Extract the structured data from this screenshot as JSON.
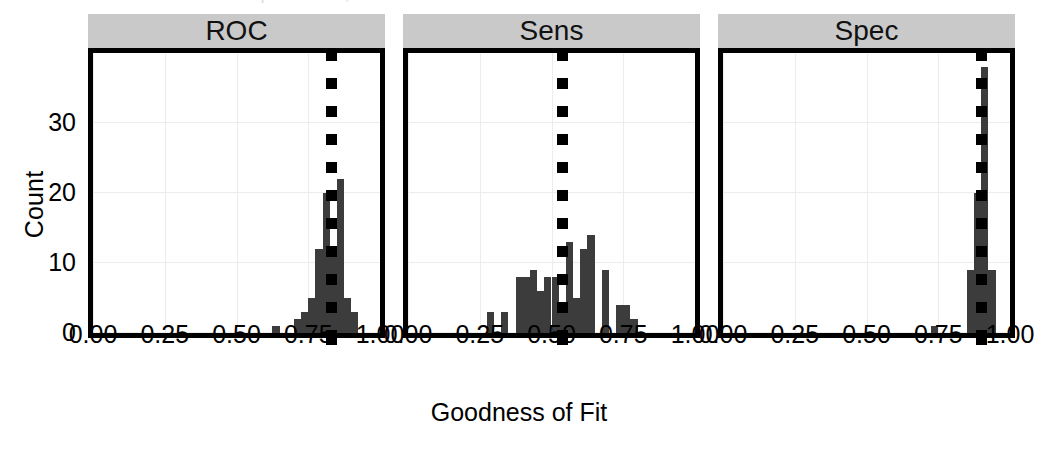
{
  "figure": {
    "clipped_title": "Distribution of model performance, vertical dotted lines",
    "xlabel": "Goodness of Fit",
    "ylabel": "Count"
  },
  "axes": {
    "y_ticks": [
      "0",
      "10",
      "20",
      "30"
    ],
    "y_tick_values": [
      0,
      10,
      20,
      30
    ],
    "ylim": [
      0,
      40
    ],
    "x_ticks": [
      "0.00",
      "0.25",
      "0.50",
      "0.75",
      "1.00"
    ],
    "x_tick_values": [
      0.0,
      0.25,
      0.5,
      0.75,
      1.0
    ],
    "xlim": [
      0,
      1
    ]
  },
  "colors": {
    "strip_background": "#c9c9c9",
    "bar_fill": "#3c3c3c",
    "panel_border": "#000000",
    "grid": "#ececec",
    "refline": "#000000",
    "page_background": "#ffffff"
  },
  "chart_data": {
    "type": "bar",
    "title": "",
    "xlabel": "Goodness of Fit",
    "ylabel": "Count",
    "xlim": [
      0,
      1
    ],
    "ylim": [
      0,
      40
    ],
    "grid": true,
    "legend": "none",
    "facet_labels": [
      "ROC",
      "Sens",
      "Spec"
    ],
    "bin_width": 0.025,
    "panels": [
      {
        "name": "ROC",
        "reference_line": 0.83,
        "bins": [
          {
            "x": 0.6375,
            "count": 1
          },
          {
            "x": 0.7125,
            "count": 2
          },
          {
            "x": 0.7375,
            "count": 3
          },
          {
            "x": 0.7625,
            "count": 5
          },
          {
            "x": 0.7875,
            "count": 12
          },
          {
            "x": 0.8125,
            "count": 20
          },
          {
            "x": 0.8375,
            "count": 12
          },
          {
            "x": 0.8625,
            "count": 22
          },
          {
            "x": 0.8875,
            "count": 5
          },
          {
            "x": 0.9125,
            "count": 3
          }
        ]
      },
      {
        "name": "Sens",
        "reference_line": 0.54,
        "bins": [
          {
            "x": 0.2875,
            "count": 3
          },
          {
            "x": 0.3375,
            "count": 3
          },
          {
            "x": 0.3875,
            "count": 8
          },
          {
            "x": 0.4125,
            "count": 8
          },
          {
            "x": 0.4375,
            "count": 9
          },
          {
            "x": 0.4625,
            "count": 6
          },
          {
            "x": 0.4875,
            "count": 8
          },
          {
            "x": 0.5125,
            "count": 8
          },
          {
            "x": 0.5375,
            "count": 4
          },
          {
            "x": 0.5625,
            "count": 13
          },
          {
            "x": 0.5875,
            "count": 5
          },
          {
            "x": 0.6125,
            "count": 12
          },
          {
            "x": 0.6375,
            "count": 14
          },
          {
            "x": 0.6875,
            "count": 9
          },
          {
            "x": 0.7375,
            "count": 4
          },
          {
            "x": 0.7625,
            "count": 4
          },
          {
            "x": 0.7875,
            "count": 2
          }
        ]
      },
      {
        "name": "Spec",
        "reference_line": 0.9,
        "bins": [
          {
            "x": 0.7375,
            "count": 1
          },
          {
            "x": 0.8625,
            "count": 9
          },
          {
            "x": 0.8875,
            "count": 20
          },
          {
            "x": 0.9125,
            "count": 38
          },
          {
            "x": 0.9375,
            "count": 9
          }
        ]
      }
    ]
  }
}
